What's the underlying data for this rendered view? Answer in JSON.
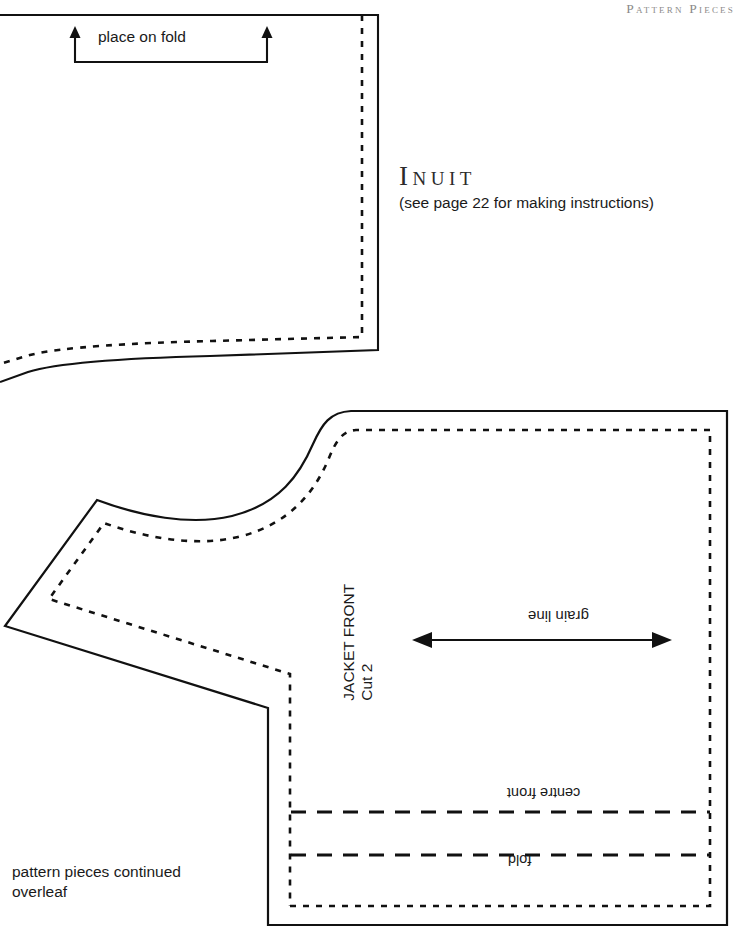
{
  "page": {
    "running_header": "Pattern Pieces",
    "background_color": "#ffffff",
    "ink_color": "#1a1a1a",
    "header_color": "#8b8a89"
  },
  "title": {
    "name": "Inuit",
    "subtitle": "(see page 22 for making instructions)"
  },
  "pieces": {
    "upper": {
      "fold_label": "place on fold"
    },
    "jacket_front": {
      "piece_name": "JACKET FRONT",
      "cut_instruction": "Cut 2",
      "grain_line_label": "grain line",
      "centre_front_label": "centre front",
      "fold_label": "fold"
    }
  },
  "footer": {
    "line1": "pattern pieces continued",
    "line2": "overleaf"
  }
}
